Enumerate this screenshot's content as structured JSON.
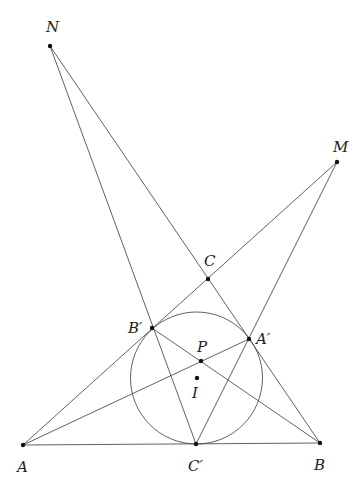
{
  "diagram": {
    "type": "geometry-construction",
    "stroke_color": "#3a3a3a",
    "point_color": "#111111",
    "incircle": {
      "center": "I",
      "cx": 196.5,
      "cy": 378,
      "r": 66
    },
    "points": [
      {
        "id": "N",
        "label": "N",
        "x": 50,
        "y": 46,
        "lx": 46,
        "ly": 32
      },
      {
        "id": "M",
        "label": "M",
        "x": 337,
        "y": 162,
        "lx": 333,
        "ly": 152
      },
      {
        "id": "C",
        "label": "C",
        "x": 208,
        "y": 279,
        "lx": 204,
        "ly": 266
      },
      {
        "id": "Bp",
        "label": "B′",
        "x": 152,
        "y": 328,
        "lx": 128,
        "ly": 333
      },
      {
        "id": "Ap",
        "label": "A′",
        "x": 249,
        "y": 339,
        "lx": 256,
        "ly": 344
      },
      {
        "id": "P",
        "label": "P",
        "x": 201,
        "y": 361,
        "lx": 197,
        "ly": 352
      },
      {
        "id": "I",
        "label": "I",
        "x": 197,
        "y": 378,
        "lx": 192,
        "ly": 398
      },
      {
        "id": "A",
        "label": "A",
        "x": 23,
        "y": 445,
        "lx": 17,
        "ly": 472
      },
      {
        "id": "Cp",
        "label": "C′",
        "x": 196,
        "y": 444,
        "lx": 188,
        "ly": 471
      },
      {
        "id": "B",
        "label": "B",
        "x": 320,
        "y": 443,
        "lx": 314,
        "ly": 470
      }
    ],
    "segments": [
      {
        "from": "N",
        "to": "Cp",
        "name": "segment-n-cprime"
      },
      {
        "from": "N",
        "to": "B",
        "name": "segment-n-b"
      },
      {
        "from": "M",
        "to": "A",
        "name": "segment-m-a"
      },
      {
        "from": "M",
        "to": "Cp",
        "name": "segment-m-cprime"
      },
      {
        "from": "A",
        "to": "Ap",
        "name": "segment-a-aprime"
      },
      {
        "from": "Bp",
        "to": "B",
        "name": "segment-bprime-b"
      },
      {
        "from": "A",
        "to": "B",
        "name": "segment-a-b"
      }
    ]
  }
}
